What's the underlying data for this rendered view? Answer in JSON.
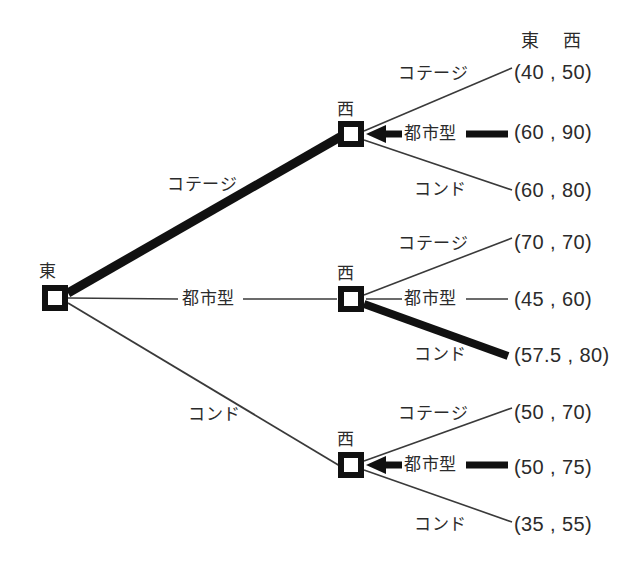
{
  "diagram": {
    "type": "extensive-form-game-tree",
    "header": {
      "player1": "東",
      "player2": "西"
    },
    "root": {
      "label": "東",
      "player": "東"
    },
    "decision_nodes": [
      {
        "label": "西",
        "player": "西"
      },
      {
        "label": "西",
        "player": "西"
      },
      {
        "label": "西",
        "player": "西"
      }
    ],
    "root_branches": [
      {
        "label": "コテージ",
        "bold": true
      },
      {
        "label": "都市型",
        "bold": false
      },
      {
        "label": "コンド",
        "bold": false
      }
    ],
    "subgames": [
      {
        "branches": [
          {
            "label": "コテージ",
            "payoff": "(40 , 50)",
            "bold": false
          },
          {
            "label": "都市型",
            "payoff": "(60 , 90)",
            "bold": true
          },
          {
            "label": "コンド",
            "payoff": "(60 , 80)",
            "bold": false
          }
        ]
      },
      {
        "branches": [
          {
            "label": "コテージ",
            "payoff": "(70 , 70)",
            "bold": false
          },
          {
            "label": "都市型",
            "payoff": "(45 , 60)",
            "bold": false
          },
          {
            "label": "コンド",
            "payoff": "(57.5 , 80)",
            "bold": true
          }
        ]
      },
      {
        "branches": [
          {
            "label": "コテージ",
            "payoff": "(50 , 70)",
            "bold": false
          },
          {
            "label": "都市型",
            "payoff": "(50 , 75)",
            "bold": true
          },
          {
            "label": "コンド",
            "payoff": "(35 , 55)",
            "bold": false
          }
        ]
      }
    ],
    "colors": {
      "ink": "#1c1c1c",
      "line": "#3a3a3a",
      "bold_line": "#111111",
      "background": "#ffffff"
    }
  }
}
